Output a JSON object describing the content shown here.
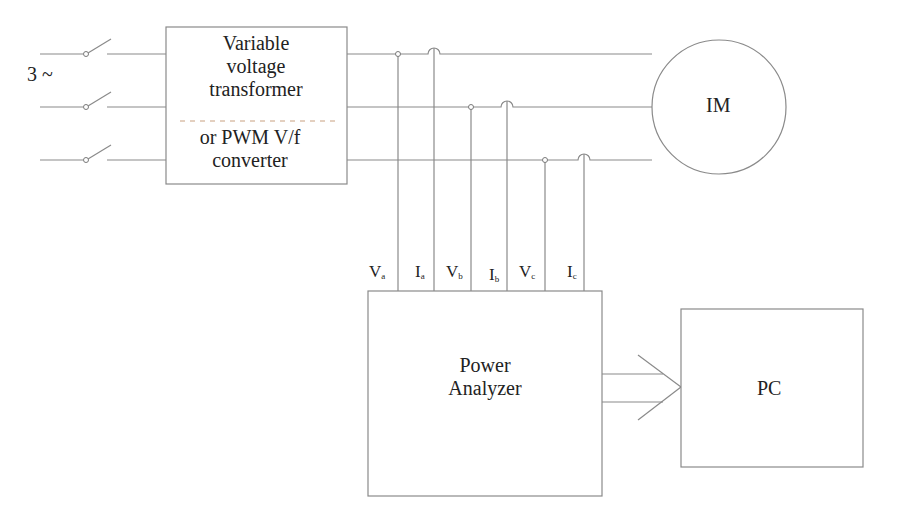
{
  "diagram": {
    "source_label": "3 ~",
    "converter": {
      "line1": "Variable",
      "line2": "voltage",
      "line3": "transformer",
      "line4": "or PWM V/f",
      "line5": "converter"
    },
    "motor_label": "IM",
    "analyzer": {
      "line1": "Power",
      "line2": "Analyzer"
    },
    "pc_label": "PC",
    "signals": [
      {
        "main": "V",
        "sub": "a"
      },
      {
        "main": "I",
        "sub": "a"
      },
      {
        "main": "V",
        "sub": "b"
      },
      {
        "main": "I",
        "sub": "b"
      },
      {
        "main": "V",
        "sub": "c"
      },
      {
        "main": "I",
        "sub": "c"
      }
    ],
    "colors": {
      "line": "#8a8a8a",
      "text": "#222222",
      "dash": "#c8a080"
    }
  }
}
